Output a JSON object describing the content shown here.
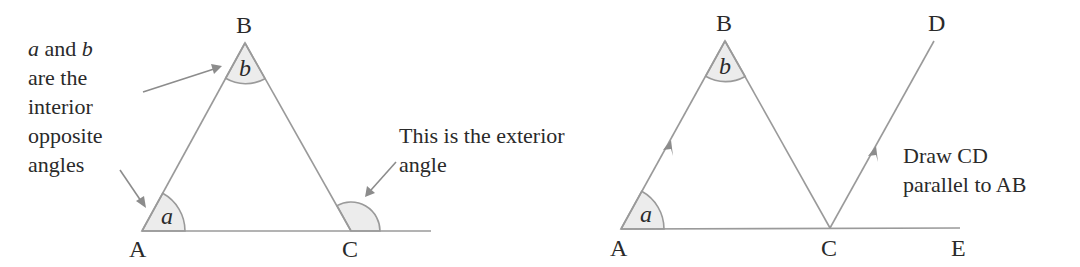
{
  "figure_left": {
    "title": "Exterior angle of a triangle",
    "vertices": {
      "A": {
        "label": "A",
        "x": 142,
        "y": 231
      },
      "B": {
        "label": "B",
        "x": 245,
        "y": 43
      },
      "C": {
        "label": "C",
        "x": 351,
        "y": 231
      }
    },
    "angle_labels": {
      "a": "a",
      "b": "b"
    },
    "note_lines": [
      {
        "prefix_italic": "a",
        "middle": " and ",
        "suffix_italic": "b"
      },
      "are the",
      "interior",
      "opposite",
      "angles"
    ],
    "exterior_note": [
      "This is the exterior",
      "angle"
    ]
  },
  "figure_right": {
    "title": "Construction with parallel line",
    "vertices": {
      "A": {
        "label": "A",
        "x": 621,
        "y": 229
      },
      "B": {
        "label": "B",
        "x": 725,
        "y": 41
      },
      "C": {
        "label": "C",
        "x": 830,
        "y": 228
      },
      "D": {
        "label": "D",
        "x": 934,
        "y": 41
      },
      "E": {
        "label": "E",
        "x": 960,
        "y": 228
      }
    },
    "angle_labels": {
      "a": "a",
      "b": "b"
    },
    "instruction": [
      "Draw CD",
      "parallel to AB"
    ]
  },
  "colors": {
    "line": "#9a9a9a",
    "fill": "#ececec",
    "text": "#2a2a2a"
  }
}
